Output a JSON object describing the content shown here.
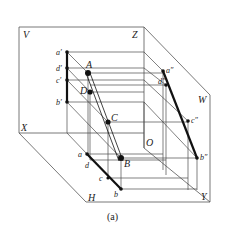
{
  "figure": {
    "caption": "(a)",
    "planes": {
      "V": "V",
      "H": "H",
      "W": "W"
    },
    "axes": {
      "X": "X",
      "Y": "Y",
      "Z": "Z",
      "O": "O"
    },
    "space_points": {
      "A": "A",
      "B": "B",
      "C": "C",
      "D": "D"
    },
    "front_projections": {
      "a": "a′",
      "b": "b′",
      "c": "c′",
      "d": "d′"
    },
    "top_projections": {
      "a": "a",
      "b": "b",
      "c": "c",
      "d": "d"
    },
    "side_projections": {
      "a": "a″",
      "b": "b″",
      "c": "c″",
      "d": "d″"
    }
  }
}
